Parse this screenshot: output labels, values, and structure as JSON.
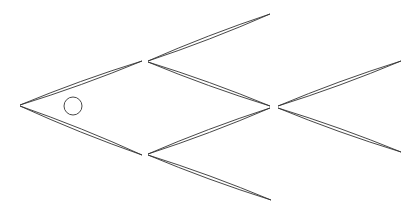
{
  "figure": {
    "background": "#ffffff",
    "stroke_color": "#333333",
    "eye": {
      "cx": 73,
      "cy": 106,
      "r": 9
    },
    "leaves": [
      {
        "name": "head-upper",
        "from": [
          20,
          105
        ],
        "to": [
          142,
          61
        ],
        "bulge": 3
      },
      {
        "name": "head-lower",
        "from": [
          20,
          106
        ],
        "to": [
          142,
          155
        ],
        "bulge": 3
      },
      {
        "name": "fin-top",
        "from": [
          148,
          61
        ],
        "to": [
          270,
          14
        ],
        "bulge": 3
      },
      {
        "name": "body-upper",
        "from": [
          148,
          62
        ],
        "to": [
          270,
          106
        ],
        "bulge": 3
      },
      {
        "name": "body-lower",
        "from": [
          148,
          154
        ],
        "to": [
          270,
          108
        ],
        "bulge": 3
      },
      {
        "name": "fin-bottom",
        "from": [
          148,
          155
        ],
        "to": [
          271,
          200
        ],
        "bulge": 3
      },
      {
        "name": "tail-upper",
        "from": [
          278,
          106
        ],
        "to": [
          401,
          61
        ],
        "bulge": 3
      },
      {
        "name": "tail-lower",
        "from": [
          278,
          108
        ],
        "to": [
          401,
          152
        ],
        "bulge": 3
      }
    ]
  }
}
